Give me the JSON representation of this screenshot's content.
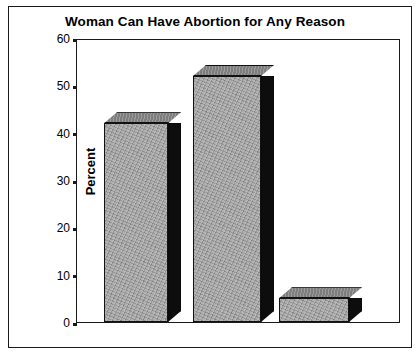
{
  "chart_data": {
    "type": "bar",
    "title": "Woman Can Have Abortion for Any Reason",
    "xlabel": "",
    "ylabel": "Percent",
    "categories": [
      "YES",
      "NO",
      "DK"
    ],
    "values": [
      42,
      52,
      5
    ],
    "ylim": [
      0,
      60
    ],
    "yticks": [
      0,
      10,
      20,
      30,
      40,
      50,
      60
    ],
    "ytick_labels": [
      "0",
      "10",
      "20",
      "30",
      "40",
      "50",
      "60"
    ],
    "grid": false,
    "legend": false,
    "style": "3d-bars-grayscale",
    "colors": {
      "bar_front": "#a2a2a2",
      "bar_side": "#0d0d0d",
      "bar_top": "#8e8e8e",
      "axis": "#1a1a1a",
      "background": "#ffffff",
      "text": "#000000"
    }
  }
}
